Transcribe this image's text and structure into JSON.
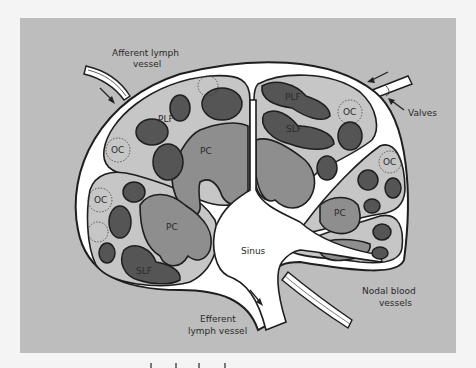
{
  "figure": {
    "colors": {
      "background": "#bdbdbd",
      "sinus": "#ffffff",
      "cortex": "#c6c6c6",
      "paracortex": "#8e8e8e",
      "follicle": "#555555",
      "outline": "#1e1e1e"
    },
    "external_labels": {
      "afferent_line1": "Afferent lymph",
      "afferent_line2": "vessel",
      "valves": "Valves",
      "nodal_line1": "Nodal blood",
      "nodal_line2": "vessels",
      "efferent_line1": "Efferent",
      "efferent_line2": "lymph vessel",
      "sinus": "Sinus"
    },
    "internal_labels": {
      "plf_left": "PLF",
      "plf_right": "PLF",
      "slf_right": "SLF",
      "slf_left": "SLF",
      "oc_left_upper": "OC",
      "oc_left_lower": "OC",
      "oc_right_upper": "OC",
      "oc_right_mid": "OC",
      "pc_top_left": "PC",
      "pc_left": "PC",
      "pc_right": "PC"
    }
  }
}
